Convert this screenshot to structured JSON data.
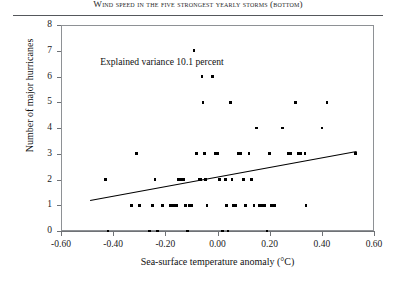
{
  "header": {
    "running_title": "Wind speed in the five strongest yearly storms (bottom)"
  },
  "annotation": {
    "text": "Explained variance 10.1 percent"
  },
  "axes": {
    "x_title": "Sea-surface temperature anomaly (°C)",
    "y_title": "Number of major hurricanes",
    "x_ticks": [
      "-0.60",
      "-0.40",
      "-0.20",
      "0.00",
      "0.20",
      "0.40",
      "0.60"
    ],
    "y_ticks": [
      "0",
      "1",
      "2",
      "3",
      "4",
      "5",
      "6",
      "7",
      "8"
    ]
  },
  "chart_data": {
    "type": "scatter",
    "title": "Wind speed in the five strongest yearly storms (bottom)",
    "xlabel": "Sea-surface temperature anomaly (°C)",
    "ylabel": "Number of major hurricanes",
    "xlim": [
      -0.6,
      0.6
    ],
    "ylim": [
      0,
      8
    ],
    "xticks": [
      -0.6,
      -0.4,
      -0.2,
      0.0,
      0.2,
      0.4,
      0.6
    ],
    "yticks": [
      0,
      1,
      2,
      3,
      4,
      5,
      6,
      7,
      8
    ],
    "grid": false,
    "legend": null,
    "annotations": [
      {
        "text": "Explained variance 10.1 percent",
        "x": -0.45,
        "y": 6.55
      }
    ],
    "marker": {
      "shape": "square",
      "color": "#000000",
      "size": 2.6
    },
    "points": [
      {
        "x": -0.43,
        "y": 2
      },
      {
        "x": -0.42,
        "y": 0
      },
      {
        "x": -0.33,
        "y": 1
      },
      {
        "x": -0.31,
        "y": 3
      },
      {
        "x": -0.3,
        "y": 1
      },
      {
        "x": -0.26,
        "y": 0
      },
      {
        "x": -0.25,
        "y": 1
      },
      {
        "x": -0.24,
        "y": 2
      },
      {
        "x": -0.23,
        "y": 0
      },
      {
        "x": -0.21,
        "y": 1
      },
      {
        "x": -0.18,
        "y": 1
      },
      {
        "x": -0.17,
        "y": 1
      },
      {
        "x": -0.16,
        "y": 1
      },
      {
        "x": -0.155,
        "y": 1
      },
      {
        "x": -0.15,
        "y": 2
      },
      {
        "x": -0.14,
        "y": 2
      },
      {
        "x": -0.135,
        "y": 2
      },
      {
        "x": -0.13,
        "y": 2
      },
      {
        "x": -0.125,
        "y": 1
      },
      {
        "x": -0.12,
        "y": 1
      },
      {
        "x": -0.115,
        "y": 0
      },
      {
        "x": -0.11,
        "y": 1
      },
      {
        "x": -0.1,
        "y": 1
      },
      {
        "x": -0.09,
        "y": 7
      },
      {
        "x": -0.08,
        "y": 3
      },
      {
        "x": -0.07,
        "y": 2
      },
      {
        "x": -0.065,
        "y": 2
      },
      {
        "x": -0.06,
        "y": 6
      },
      {
        "x": -0.055,
        "y": 5
      },
      {
        "x": -0.05,
        "y": 3
      },
      {
        "x": -0.045,
        "y": 2
      },
      {
        "x": -0.04,
        "y": 1
      },
      {
        "x": -0.02,
        "y": 6
      },
      {
        "x": -0.01,
        "y": 3
      },
      {
        "x": 0.0,
        "y": 3
      },
      {
        "x": 0.005,
        "y": 2
      },
      {
        "x": 0.01,
        "y": 2
      },
      {
        "x": 0.02,
        "y": 0
      },
      {
        "x": 0.03,
        "y": 2
      },
      {
        "x": 0.035,
        "y": 1
      },
      {
        "x": 0.04,
        "y": 0
      },
      {
        "x": 0.05,
        "y": 5
      },
      {
        "x": 0.055,
        "y": 2
      },
      {
        "x": 0.06,
        "y": 1
      },
      {
        "x": 0.07,
        "y": 1
      },
      {
        "x": 0.08,
        "y": 3
      },
      {
        "x": 0.09,
        "y": 3
      },
      {
        "x": 0.1,
        "y": 2
      },
      {
        "x": 0.105,
        "y": 1
      },
      {
        "x": 0.11,
        "y": 1
      },
      {
        "x": 0.12,
        "y": 3
      },
      {
        "x": 0.13,
        "y": 2
      },
      {
        "x": 0.14,
        "y": 1
      },
      {
        "x": 0.15,
        "y": 4
      },
      {
        "x": 0.16,
        "y": 1
      },
      {
        "x": 0.17,
        "y": 1
      },
      {
        "x": 0.18,
        "y": 1
      },
      {
        "x": 0.19,
        "y": 0
      },
      {
        "x": 0.2,
        "y": 3
      },
      {
        "x": 0.205,
        "y": 1
      },
      {
        "x": 0.21,
        "y": 1
      },
      {
        "x": 0.22,
        "y": 1
      },
      {
        "x": 0.25,
        "y": 4
      },
      {
        "x": 0.27,
        "y": 3
      },
      {
        "x": 0.28,
        "y": 3
      },
      {
        "x": 0.3,
        "y": 5
      },
      {
        "x": 0.31,
        "y": 3
      },
      {
        "x": 0.315,
        "y": 3
      },
      {
        "x": 0.32,
        "y": 3
      },
      {
        "x": 0.335,
        "y": 3
      },
      {
        "x": 0.34,
        "y": 1
      },
      {
        "x": 0.4,
        "y": 4
      },
      {
        "x": 0.42,
        "y": 5
      },
      {
        "x": 0.53,
        "y": 3
      }
    ],
    "trendline": {
      "type": "linear-fit",
      "x_start": -0.49,
      "y_start": 1.22,
      "x_end": 0.53,
      "y_end": 3.12,
      "explained_variance_percent": 10.1
    }
  }
}
